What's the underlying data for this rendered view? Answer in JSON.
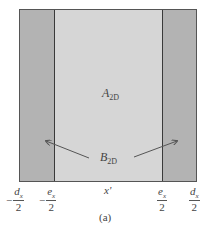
{
  "figure": {
    "caption": "(a)",
    "regions": {
      "center_label": {
        "main": "A",
        "sub": "2D"
      },
      "side_label": {
        "main": "B",
        "sub": "2D"
      }
    },
    "colors": {
      "center_fill": "#d6d6d6",
      "side_fill": "#b3b3b3",
      "border": "#3a3a3a",
      "arrow": "#555555"
    },
    "axis": {
      "variable": "x'",
      "ticks": [
        {
          "sign": "−",
          "num": "d",
          "num_sub": "x",
          "den": "2"
        },
        {
          "sign": "−",
          "num": "e",
          "num_sub": "x",
          "den": "2"
        },
        {
          "sign": "",
          "num": "e",
          "num_sub": "x",
          "den": "2"
        },
        {
          "sign": "",
          "num": "d",
          "num_sub": "x",
          "den": "2"
        }
      ]
    }
  }
}
